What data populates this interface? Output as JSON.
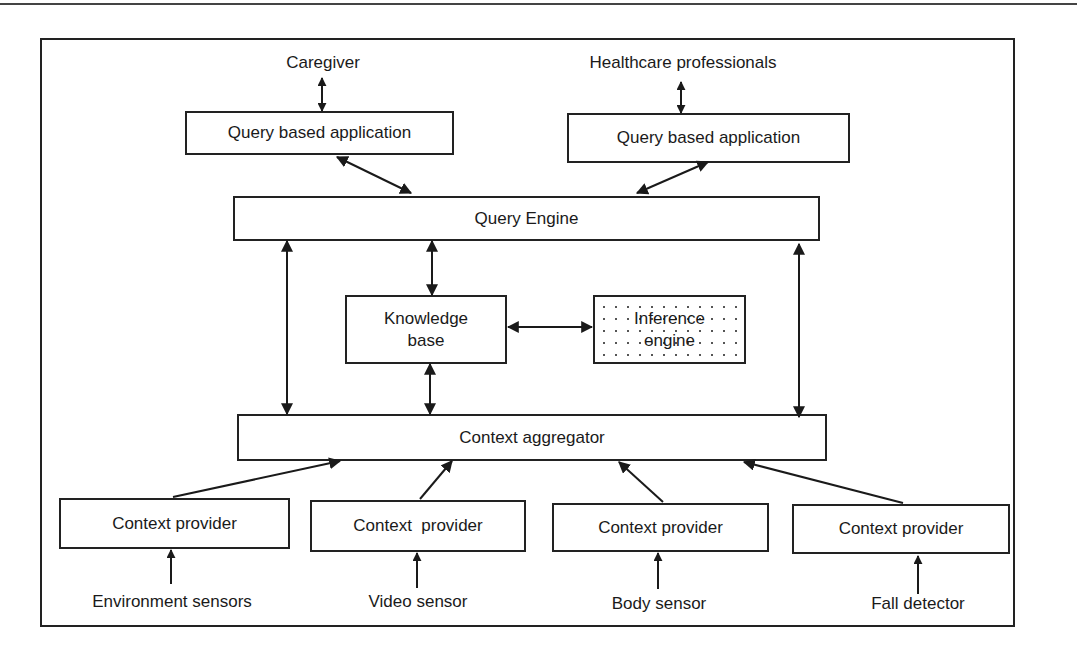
{
  "diagram": {
    "actors": {
      "caregiver": "Caregiver",
      "healthcare": "Healthcare professionals"
    },
    "applications": [
      {
        "label": "Query based application"
      },
      {
        "label": "Query based application"
      }
    ],
    "query_engine": "Query Engine",
    "knowledge_base": {
      "line1": "Knowledge",
      "line2": "base"
    },
    "inference_engine": {
      "line1": "Inference",
      "line2": "engine"
    },
    "context_aggregator": "Context aggregator",
    "providers": [
      {
        "label": "Context provider",
        "source": "Environment sensors"
      },
      {
        "label": "Context  provider",
        "source": "Video sensor"
      },
      {
        "label": "Context provider",
        "source": "Body sensor"
      },
      {
        "label": "Context provider",
        "source": "Fall detector"
      }
    ],
    "colors": {
      "stroke": "#222222",
      "text": "#1a1a1a",
      "background": "#ffffff"
    }
  }
}
